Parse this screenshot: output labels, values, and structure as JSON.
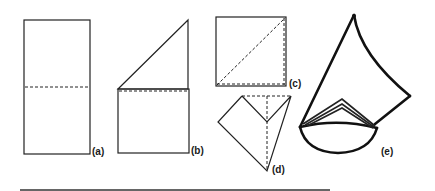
{
  "figure": {
    "panels": [
      {
        "id": "a",
        "label": "(a)",
        "description": "Rectangle with dashed horizontal fold line at middle"
      },
      {
        "id": "b",
        "label": "(b)",
        "description": "Top half folded diagonally to form triangle above rectangle"
      },
      {
        "id": "c",
        "label": "(c)",
        "description": "Square with dashed diagonal fold line"
      },
      {
        "id": "d",
        "label": "(d)",
        "description": "Folded kite shape with dashed vertical and top edges"
      },
      {
        "id": "e",
        "label": "(e)",
        "description": "Finished cone shape with layered folds at base"
      }
    ]
  },
  "colors": {
    "background": "#ffffff",
    "ink": "#222222"
  }
}
